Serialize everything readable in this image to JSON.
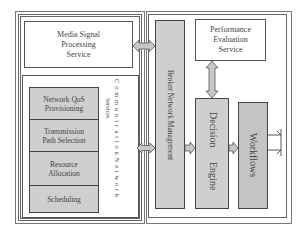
{
  "diagram": {
    "left_panel": {
      "media_signal": "Media Signal\nProcessing\nService",
      "communication_group": {
        "title_line1": "C o m m u n i c a t i o n   N e t w o r k",
        "title_line2": "Services",
        "items": [
          {
            "label": "Network QoS\nProvisioning"
          },
          {
            "label": "Transmission\nPath Selection"
          },
          {
            "label": "Resource\nAllocation"
          },
          {
            "label": "Scheduling"
          }
        ]
      }
    },
    "right_panel": {
      "broker": "Broker Network Management",
      "performance": "Performance\nEvaluation\nService",
      "decision_engine_line1": "Decision",
      "decision_engine_line2": "Engine",
      "workflows": "Workflows"
    },
    "colors": {
      "box_fill": "#cfcfcf",
      "arrow_fill": "#c8c8c8",
      "line": "#555555"
    }
  }
}
